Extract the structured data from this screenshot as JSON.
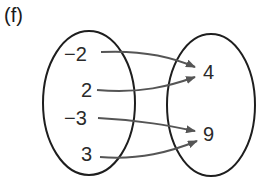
{
  "part_label": "(f)",
  "domain_set": {
    "elements": [
      "−2",
      "2",
      "−3",
      "3"
    ]
  },
  "range_set": {
    "elements": [
      "4",
      "9"
    ]
  },
  "mappings": [
    {
      "from": "−2",
      "to": "4"
    },
    {
      "from": "2",
      "to": "4"
    },
    {
      "from": "−3",
      "to": "9"
    },
    {
      "from": "3",
      "to": "9"
    }
  ],
  "colors": {
    "outline": "#1e1e1e",
    "arrow": "#555555",
    "text": "#2a2a2a"
  }
}
